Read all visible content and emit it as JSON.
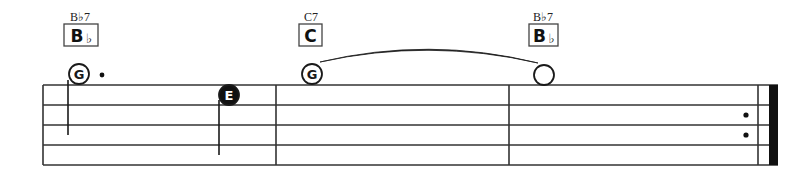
{
  "colors": {
    "ink": "#1a1a1a",
    "staff": "#333333",
    "background": "#ffffff",
    "note_fill_dark": "#111111",
    "note_letter_light": "#ffffff"
  },
  "staff": {
    "line_count": 5,
    "top_y": 85,
    "spacing": 20,
    "left_x": 43,
    "right_x": 778
  },
  "barlines": [
    {
      "type": "start",
      "x": 43
    },
    {
      "type": "single",
      "x": 276
    },
    {
      "type": "single",
      "x": 509
    },
    {
      "type": "final-repeat-thin",
      "x": 758
    },
    {
      "type": "final-repeat-thick",
      "x": 769,
      "width": 9
    }
  ],
  "repeat_dots": [
    {
      "x": 746,
      "y": 115
    },
    {
      "x": 746,
      "y": 135
    }
  ],
  "chords": [
    {
      "name": "B♭7",
      "box_letter": "B",
      "box_accidental": "♭",
      "label_x": 80,
      "box_x": 64,
      "box_w": 34
    },
    {
      "name": "C7",
      "box_letter": "C",
      "box_accidental": "",
      "label_x": 311,
      "box_x": 299,
      "box_w": 23
    },
    {
      "name": "B♭7",
      "box_letter": "B",
      "box_accidental": "♭",
      "label_x": 543,
      "box_x": 529,
      "box_w": 29
    }
  ],
  "notes": [
    {
      "letter": "G",
      "x": 79,
      "y": 74,
      "filled": false,
      "stem": {
        "x": 68,
        "y1": 80,
        "y2": 135
      },
      "dotted": true,
      "dot_x": 102,
      "dot_y": 75,
      "duration": "dotted-half"
    },
    {
      "letter": "E",
      "x": 229,
      "y": 95,
      "filled": true,
      "stem": {
        "x": 219,
        "y1": 100,
        "y2": 155
      },
      "dotted": false,
      "duration": "quarter"
    },
    {
      "letter": "G",
      "x": 312,
      "y": 74,
      "filled": false,
      "stem": null,
      "dotted": false,
      "duration": "whole",
      "tie_start": true
    },
    {
      "letter": "",
      "x": 544,
      "y": 75,
      "filled": false,
      "stem": null,
      "dotted": false,
      "duration": "whole",
      "tie_end": true
    }
  ],
  "tie": {
    "x1": 320,
    "y1": 62,
    "x2": 538,
    "y2": 63,
    "peak_y": 46
  }
}
